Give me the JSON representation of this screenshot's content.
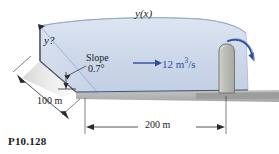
{
  "figure": {
    "number": "P10.128",
    "type": "open-channel-flow-diagram"
  },
  "labels": {
    "water_surface": "y(x)",
    "depth_unknown": "y?",
    "slope_title": "Slope",
    "slope_value": "0.7°",
    "flow_rate_value": "12 m",
    "flow_rate_exponent": "3",
    "flow_rate_unit": "/s",
    "length_upstream": "100 m",
    "length_channel": "200 m"
  },
  "icons": {
    "flow_arrow": "right-arrow-icon",
    "spill_arrow": "curved-arrow-icon",
    "dimension_arrow": "dimension-arrow-icon"
  },
  "colors": {
    "water_fill": "#ccd7e9",
    "water_fill_light": "#dde5f2",
    "water_edge": "#9fb2cf",
    "gate_fill": "#b8b8b2",
    "gate_edge": "#6f6f6a",
    "ground_fill": "#b3b5b2",
    "flow_accent": "#2d4f9e",
    "line_dark": "#262626",
    "shadow": "#d9d9d9"
  },
  "geometry": {
    "channel_length_m": 200,
    "upstream_length_m": 100,
    "bed_slope_deg": 0.7,
    "discharge_m3_per_s": 12
  }
}
